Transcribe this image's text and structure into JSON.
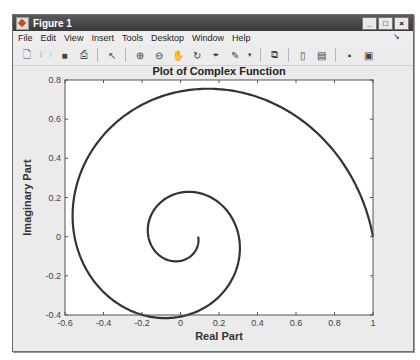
{
  "window": {
    "title": "Figure 1",
    "controls": {
      "minimize": "_",
      "maximize": "□",
      "close": "×"
    }
  },
  "menubar": {
    "items": [
      "File",
      "Edit",
      "View",
      "Insert",
      "Tools",
      "Desktop",
      "Window",
      "Help"
    ],
    "dock_icon": "dock-arrow-icon"
  },
  "toolbar": {
    "buttons": [
      {
        "name": "new-figure",
        "icon": "new-file-icon"
      },
      {
        "name": "open-file",
        "icon": "folder-open-icon"
      },
      {
        "name": "save-figure",
        "icon": "save-icon"
      },
      {
        "name": "print-figure",
        "icon": "print-icon"
      },
      {
        "name": "edit-plot",
        "icon": "pointer-arrow-icon"
      },
      {
        "name": "zoom-in",
        "icon": "zoom-in-icon"
      },
      {
        "name": "zoom-out",
        "icon": "zoom-out-icon"
      },
      {
        "name": "pan",
        "icon": "hand-icon"
      },
      {
        "name": "rotate-3d",
        "icon": "rotate-3d-icon"
      },
      {
        "name": "data-cursor",
        "icon": "data-cursor-icon"
      },
      {
        "name": "brush",
        "icon": "brush-icon"
      },
      {
        "name": "link-plot",
        "icon": "link-plot-icon"
      },
      {
        "name": "insert-colorbar",
        "icon": "colorbar-icon"
      },
      {
        "name": "insert-legend",
        "icon": "legend-icon"
      },
      {
        "name": "hide-plot-tools",
        "icon": "hide-tools-icon"
      },
      {
        "name": "show-plot-tools",
        "icon": "show-tools-icon"
      }
    ]
  },
  "chart_data": {
    "type": "line",
    "title": "Plot of Complex Function",
    "xlabel": "Real Part",
    "ylabel": "Imaginary Part",
    "xlim": [
      -0.6,
      1
    ],
    "ylim": [
      -0.4,
      0.8
    ],
    "xticks": [
      -0.6,
      -0.4,
      -0.2,
      0,
      0.2,
      0.4,
      0.6,
      0.8,
      1
    ],
    "xtick_labels": [
      "-0.6",
      "-0.4",
      "-0.2",
      "0",
      "0.2",
      "0.4",
      "0.6",
      "0.8",
      "1"
    ],
    "yticks": [
      -0.4,
      -0.2,
      0,
      0.2,
      0.4,
      0.6,
      0.8
    ],
    "ytick_labels": [
      "-0.4",
      "-0.2",
      "0",
      "0.2",
      "0.4",
      "0.6",
      "0.8"
    ],
    "grid": false,
    "legend": null,
    "line_color": "#333333",
    "series": [
      {
        "name": "f(t) = exp((-0.19 + i) t), t in [0, 4π]",
        "decay": 0.19,
        "t_range": [
          0,
          12.566
        ],
        "key_points": [
          {
            "x": 1.0,
            "y": 0.0
          },
          {
            "x": 0.0,
            "y": 0.74
          },
          {
            "x": -0.55,
            "y": 0.0
          },
          {
            "x": 0.0,
            "y": -0.41
          },
          {
            "x": 0.3,
            "y": 0.0
          },
          {
            "x": 0.0,
            "y": 0.22
          },
          {
            "x": -0.166,
            "y": 0.0
          },
          {
            "x": 0.0,
            "y": -0.12
          },
          {
            "x": 0.09,
            "y": 0.0
          }
        ]
      }
    ]
  }
}
